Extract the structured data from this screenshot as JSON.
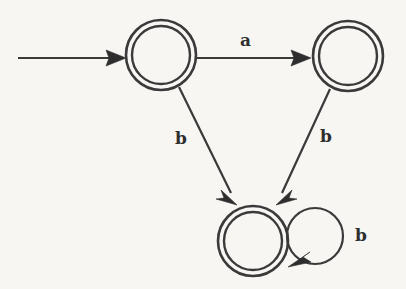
{
  "diagram": {
    "kind": "finite-state-automaton",
    "background_color": "#f7f6f3",
    "stroke_color": "#3a3a3a",
    "label_color": "#2f2f2f",
    "states": [
      {
        "id": "q0",
        "name": "state-top-left",
        "accepting": true,
        "double_circle": true,
        "cx": 161,
        "cy": 55,
        "r_outer": 35,
        "r_inner": 29,
        "label": ""
      },
      {
        "id": "q1",
        "name": "state-top-right",
        "accepting": true,
        "double_circle": true,
        "cx": 348,
        "cy": 56,
        "r_outer": 35,
        "r_inner": 29,
        "label": ""
      },
      {
        "id": "q2",
        "name": "state-bottom",
        "accepting": true,
        "double_circle": true,
        "cx": 253,
        "cy": 241,
        "r_outer": 35,
        "r_inner": 29,
        "label": ""
      }
    ],
    "start_arrow": {
      "name": "start-arrow",
      "x1": 18,
      "y1": 58,
      "x2": 126,
      "y2": 58
    },
    "transitions": [
      {
        "name": "transition-q0-q1",
        "from": "q0",
        "to": "q1",
        "symbol": "a",
        "label_x": 240,
        "label_y": 32,
        "x1": 197,
        "y1": 58,
        "x2": 311,
        "y2": 58
      },
      {
        "name": "transition-q0-q2",
        "from": "q0",
        "to": "q2",
        "symbol": "b",
        "label_x": 175,
        "label_y": 130,
        "x1": 179,
        "y1": 87,
        "x2": 236,
        "y2": 203
      },
      {
        "name": "transition-q1-q2",
        "from": "q1",
        "to": "q2",
        "symbol": "b",
        "label_x": 320,
        "label_y": 128,
        "x1": 330,
        "y1": 89,
        "x2": 277,
        "y2": 203
      },
      {
        "name": "transition-q2-q2-self-loop",
        "from": "q2",
        "to": "q2",
        "symbol": "b",
        "label_x": 355,
        "label_y": 227,
        "loop_cx": 315,
        "loop_cy": 236,
        "loop_r": 28
      }
    ]
  }
}
